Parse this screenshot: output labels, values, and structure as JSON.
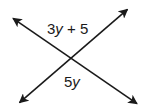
{
  "diagram": {
    "type": "intersecting-lines",
    "colors": {
      "line": "#1a1a1a",
      "background": "#ffffff"
    },
    "lines": [
      {
        "name": "line-falling",
        "from": [
          11,
          17
        ],
        "to": [
          139,
          105
        ],
        "arrows": "both"
      },
      {
        "name": "line-rising",
        "from": [
          18,
          104
        ],
        "to": [
          129,
          8
        ],
        "arrows": "both"
      }
    ],
    "intersection": [
      71,
      59
    ],
    "labels": {
      "top_angle": {
        "coef": "3",
        "var": "y",
        "rest": " + 5",
        "full": "3y + 5"
      },
      "bottom_angle": {
        "coef": "5",
        "var": "y",
        "full": "5y"
      }
    }
  }
}
